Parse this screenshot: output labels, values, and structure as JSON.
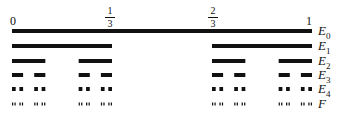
{
  "ticks": {
    "zero": "0",
    "one_third": {
      "num": "1",
      "den": "3"
    },
    "two_thirds": {
      "num": "2",
      "den": "3"
    },
    "one": "1"
  },
  "levels": [
    {
      "label": "E",
      "sub": "0"
    },
    {
      "label": "E",
      "sub": "1"
    },
    {
      "label": "E",
      "sub": "2"
    },
    {
      "label": "E",
      "sub": "3"
    },
    {
      "label": "E",
      "sub": "4"
    },
    {
      "label": "F",
      "sub": ""
    }
  ],
  "geometry": {
    "x0": 12,
    "x1": 312,
    "rows_y": [
      31,
      46,
      61,
      75,
      89,
      104
    ],
    "stroke": [
      4,
      4,
      4,
      4,
      4,
      3
    ]
  },
  "colors": {
    "ink": "#111111"
  }
}
